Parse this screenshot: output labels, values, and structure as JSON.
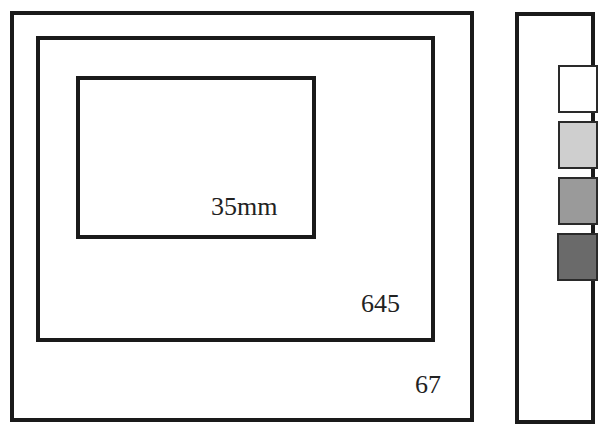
{
  "diagram": {
    "frames": [
      {
        "id": "67",
        "label": "67"
      },
      {
        "id": "645",
        "label": "645"
      },
      {
        "id": "35mm",
        "label": "35mm"
      }
    ],
    "legend_swatches": [
      {
        "color": "#ffffff"
      },
      {
        "color": "#cfcfcf"
      },
      {
        "color": "#9a9a9a"
      },
      {
        "color": "#6a6a6a"
      }
    ]
  }
}
